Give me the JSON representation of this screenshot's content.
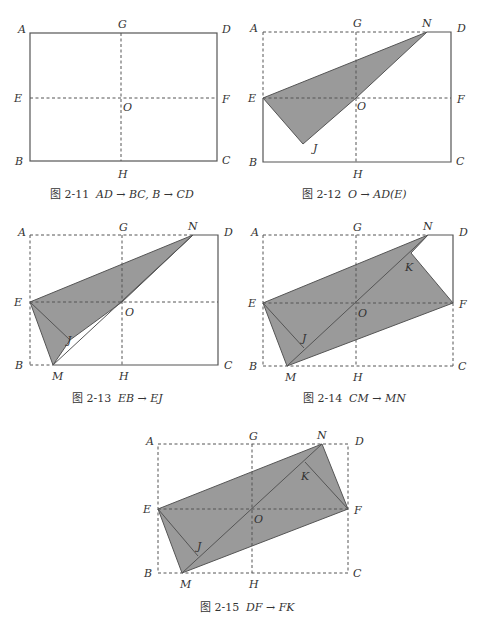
{
  "figures": [
    {
      "id": "fig-2-11",
      "caption_num": "图 2-11",
      "caption_math": "AD → BC, B → CD",
      "labels": {
        "A": "A",
        "B": "B",
        "C": "C",
        "D": "D",
        "E": "E",
        "F": "F",
        "G": "G",
        "H": "H",
        "O": "O"
      }
    },
    {
      "id": "fig-2-12",
      "caption_num": "图 2-12",
      "caption_math": "O → AD(E)",
      "labels": {
        "A": "A",
        "B": "B",
        "C": "C",
        "D": "D",
        "E": "E",
        "F": "F",
        "G": "G",
        "H": "H",
        "O": "O",
        "N": "N",
        "J": "J"
      }
    },
    {
      "id": "fig-2-13",
      "caption_num": "图 2-13",
      "caption_math": "EB → EJ",
      "labels": {
        "A": "A",
        "B": "B",
        "C": "C",
        "D": "D",
        "E": "E",
        "G": "G",
        "H": "H",
        "O": "O",
        "N": "N",
        "J": "J",
        "M": "M"
      }
    },
    {
      "id": "fig-2-14",
      "caption_num": "图 2-14",
      "caption_math": "CM → MN",
      "labels": {
        "A": "A",
        "B": "B",
        "C": "C",
        "D": "D",
        "E": "E",
        "F": "F",
        "G": "G",
        "H": "H",
        "O": "O",
        "N": "N",
        "J": "J",
        "M": "M",
        "K": "K"
      }
    },
    {
      "id": "fig-2-15",
      "caption_num": "图 2-15",
      "caption_math": "DF → FK",
      "labels": {
        "A": "A",
        "B": "B",
        "C": "C",
        "D": "D",
        "E": "E",
        "F": "F",
        "G": "G",
        "H": "H",
        "O": "O",
        "N": "N",
        "J": "J",
        "M": "M",
        "K": "K"
      }
    }
  ],
  "colors": {
    "fold_fill": "#9a9a9a",
    "stroke": "#555555",
    "text": "#333333"
  }
}
